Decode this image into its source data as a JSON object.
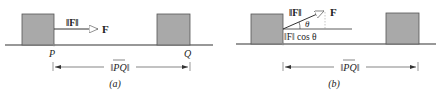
{
  "panels": [
    {
      "id": "a",
      "caption": "(a)",
      "force_magnitude_label": "‖F‖",
      "force_vector_label": "F",
      "start_point_label": "P",
      "end_point_label": "Q",
      "displacement_label": "‖PQ‖"
    },
    {
      "id": "b",
      "caption": "(b)",
      "force_magnitude_label": "‖F‖",
      "force_vector_label": "F",
      "angle_label": "θ",
      "component_label": "‖F‖ cos θ",
      "displacement_label": "‖PQ‖"
    }
  ],
  "colors": {
    "box_fill": "#a9a9a9",
    "box_stroke": "#555555",
    "line": "#333333",
    "arrow_head_fill": "#ffffff"
  }
}
